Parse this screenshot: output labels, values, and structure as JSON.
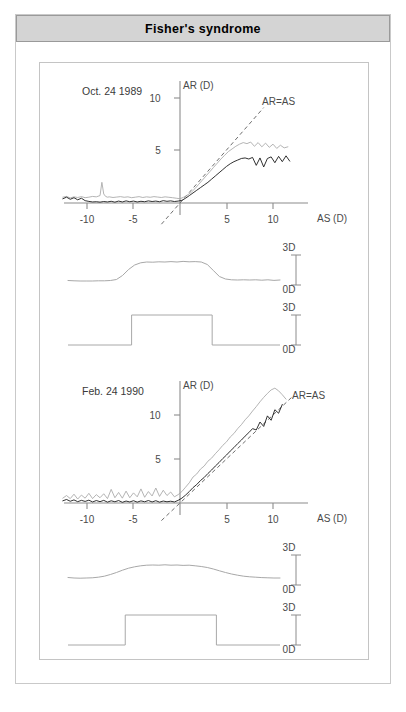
{
  "title": "Fisher's  syndrome",
  "panels": [
    {
      "date_label": "Oct. 24 1989",
      "identity_label": "AR=AS",
      "scale_top": "3D",
      "scale_bottom": "0D",
      "chart_data": {
        "type": "line",
        "title": "Oct. 24 1989",
        "xlabel": "AS (D)",
        "ylabel": "AR (D)",
        "xlim": [
          -13,
          13
        ],
        "ylim": [
          -1.2,
          11.5
        ],
        "xticks": [
          -10,
          -5,
          5,
          10
        ],
        "yticks": [
          5,
          10
        ],
        "grid": false,
        "legend": "none",
        "annotations": [
          "AR=AS"
        ],
        "series": [
          {
            "name": "accommodative-response-gray",
            "color": "#a6a6a6",
            "x": [
              -12.6,
              -12.2,
              -11.8,
              -11.4,
              -11.0,
              -10.6,
              -10.2,
              -9.8,
              -9.4,
              -9.0,
              -8.6,
              -8.4,
              -8.2,
              -8.0,
              -7.8,
              -7.6,
              -7.2,
              -6.8,
              -6.4,
              -6.0,
              -5.6,
              -5.2,
              -4.8,
              -4.4,
              -4.0,
              -3.6,
              -3.2,
              -2.8,
              -2.4,
              -2.0,
              -1.6,
              -1.2,
              -0.8,
              -0.4,
              0.0,
              0.4,
              0.8,
              1.2,
              1.6,
              2.0,
              2.4,
              2.8,
              3.2,
              3.6,
              4.0,
              4.4,
              4.8,
              5.2,
              5.6,
              6.0,
              6.4,
              6.8,
              7.2,
              7.6,
              8.0,
              8.4,
              8.8,
              9.2,
              9.6,
              10.0,
              10.4,
              10.8,
              11.2,
              11.6
            ],
            "y": [
              0.55,
              0.62,
              0.48,
              0.58,
              0.52,
              0.6,
              0.5,
              0.55,
              0.62,
              0.58,
              0.7,
              1.95,
              0.85,
              0.62,
              0.55,
              0.58,
              0.52,
              0.56,
              0.6,
              0.54,
              0.58,
              0.5,
              0.55,
              0.6,
              0.52,
              0.58,
              0.54,
              0.6,
              0.56,
              0.52,
              0.58,
              0.54,
              0.5,
              0.45,
              0.4,
              0.55,
              0.75,
              1.0,
              1.35,
              1.75,
              2.15,
              2.55,
              2.95,
              3.35,
              3.75,
              4.15,
              4.5,
              4.85,
              5.1,
              5.35,
              5.55,
              5.7,
              5.6,
              5.75,
              5.35,
              5.7,
              5.3,
              5.65,
              5.25,
              5.55,
              5.15,
              5.45,
              5.2,
              5.3
            ]
          },
          {
            "name": "accommodative-response-black",
            "color": "#1a1a1a",
            "x": [
              -12.6,
              -12.2,
              -11.8,
              -11.4,
              -11.0,
              -10.6,
              -10.2,
              -9.8,
              -9.4,
              -9.0,
              -8.6,
              -8.2,
              -7.8,
              -7.4,
              -7.0,
              -6.6,
              -6.2,
              -5.8,
              -5.4,
              -5.0,
              -4.6,
              -4.2,
              -3.8,
              -3.4,
              -3.0,
              -2.6,
              -2.2,
              -1.8,
              -1.4,
              -1.0,
              -0.6,
              -0.2,
              0.2,
              0.6,
              1.0,
              1.4,
              1.8,
              2.2,
              2.6,
              3.0,
              3.4,
              3.8,
              4.2,
              4.6,
              5.0,
              5.4,
              5.8,
              6.2,
              6.6,
              7.0,
              7.4,
              7.8,
              8.2,
              8.6,
              9.0,
              9.4,
              9.8,
              10.2,
              10.6,
              11.0,
              11.4,
              11.8
            ],
            "y": [
              0.4,
              0.55,
              0.35,
              0.5,
              0.3,
              0.45,
              0.22,
              0.15,
              0.1,
              0.12,
              0.08,
              0.14,
              0.1,
              0.16,
              0.08,
              0.18,
              0.1,
              0.2,
              0.12,
              0.18,
              0.1,
              0.16,
              0.12,
              0.2,
              0.14,
              0.18,
              0.12,
              0.22,
              0.16,
              0.2,
              0.14,
              0.18,
              0.25,
              0.45,
              0.7,
              0.95,
              1.2,
              1.45,
              1.7,
              1.95,
              2.25,
              2.55,
              2.85,
              3.15,
              3.45,
              3.7,
              3.9,
              4.05,
              4.2,
              4.25,
              4.15,
              4.3,
              3.55,
              4.25,
              3.4,
              4.2,
              4.35,
              3.8,
              4.4,
              3.9,
              4.45,
              3.95
            ]
          },
          {
            "name": "identity-line",
            "color": "#6e6e6e",
            "style": "dashed",
            "x": [
              -2.0,
              9.0
            ],
            "y": [
              -2.0,
              9.0
            ]
          }
        ]
      },
      "response_trace": {
        "type": "line",
        "name": "accommodation-response-time-trace",
        "ylim": [
          0,
          3
        ],
        "values": [
          0.45,
          0.42,
          0.4,
          0.4,
          0.4,
          0.42,
          0.42,
          0.45,
          0.55,
          0.95,
          1.55,
          2.0,
          2.22,
          2.3,
          2.28,
          2.32,
          2.3,
          2.34,
          2.3,
          2.36,
          2.32,
          2.34,
          2.3,
          2.05,
          1.45,
          0.85,
          0.6,
          0.52,
          0.5,
          0.52,
          0.5,
          0.52,
          0.48,
          0.52,
          0.46,
          0.5
        ]
      },
      "stimulus_trace": {
        "type": "step",
        "name": "stimulus-square-wave",
        "ylim": [
          0,
          3
        ],
        "low": 0,
        "high": 3,
        "step_up_frac": 0.3,
        "step_down_frac": 0.68
      }
    },
    {
      "date_label": "Feb. 24 1990",
      "identity_label": "AR=AS",
      "scale_top": "3D",
      "scale_bottom": "0D",
      "chart_data": {
        "type": "line",
        "title": "Feb. 24 1990",
        "xlabel": "AS (D)",
        "ylabel": "AR (D)",
        "xlim": [
          -13,
          13
        ],
        "ylim": [
          -1.2,
          14.0
        ],
        "xticks": [
          -10,
          -5,
          5,
          10
        ],
        "yticks": [
          5,
          10
        ],
        "grid": false,
        "legend": "none",
        "annotations": [
          "AR=AS"
        ],
        "series": [
          {
            "name": "accommodative-response-gray",
            "color": "#a6a6a6",
            "x": [
              -12.6,
              -12.2,
              -11.8,
              -11.4,
              -11.0,
              -10.6,
              -10.2,
              -9.8,
              -9.4,
              -9.0,
              -8.6,
              -8.2,
              -7.8,
              -7.4,
              -7.0,
              -6.6,
              -6.2,
              -5.8,
              -5.4,
              -5.0,
              -4.6,
              -4.2,
              -3.8,
              -3.4,
              -3.0,
              -2.6,
              -2.2,
              -1.8,
              -1.4,
              -1.0,
              -0.6,
              -0.2,
              0.2,
              0.6,
              1.0,
              1.4,
              1.8,
              2.2,
              2.6,
              3.0,
              3.4,
              3.8,
              4.2,
              4.6,
              5.0,
              5.4,
              5.8,
              6.2,
              6.6,
              7.0,
              7.4,
              7.8,
              8.2,
              8.6,
              9.0,
              9.4,
              9.8,
              10.2,
              10.6,
              11.0,
              11.4
            ],
            "y": [
              0.55,
              0.85,
              0.5,
              1.0,
              0.45,
              0.9,
              0.55,
              1.1,
              0.5,
              0.95,
              0.6,
              1.05,
              0.5,
              1.55,
              0.6,
              1.2,
              0.55,
              1.35,
              0.6,
              1.15,
              0.7,
              1.6,
              0.65,
              1.3,
              0.8,
              1.7,
              0.75,
              1.45,
              0.85,
              1.25,
              0.7,
              0.95,
              1.3,
              1.8,
              2.3,
              2.95,
              3.3,
              3.85,
              4.2,
              4.75,
              5.1,
              5.6,
              6.05,
              6.55,
              6.95,
              7.5,
              7.9,
              8.45,
              8.9,
              9.45,
              9.9,
              10.45,
              10.95,
              11.5,
              12.0,
              12.45,
              12.85,
              13.05,
              12.75,
              12.3,
              11.8
            ]
          },
          {
            "name": "accommodative-response-black",
            "color": "#1a1a1a",
            "x": [
              -12.6,
              -12.2,
              -11.8,
              -11.4,
              -11.0,
              -10.6,
              -10.2,
              -9.8,
              -9.4,
              -9.0,
              -8.6,
              -8.2,
              -7.8,
              -7.4,
              -7.0,
              -6.6,
              -6.2,
              -5.8,
              -5.4,
              -5.0,
              -4.6,
              -4.2,
              -3.8,
              -3.4,
              -3.0,
              -2.6,
              -2.2,
              -1.8,
              -1.4,
              -1.0,
              -0.6,
              -0.2,
              0.2,
              0.6,
              1.0,
              1.4,
              1.8,
              2.2,
              2.6,
              3.0,
              3.4,
              3.8,
              4.2,
              4.6,
              5.0,
              5.4,
              5.8,
              6.2,
              6.6,
              7.0,
              7.4,
              7.8,
              8.2,
              8.6,
              9.0,
              9.4,
              9.8,
              10.2,
              10.6,
              11.0
            ],
            "y": [
              0.25,
              0.4,
              0.2,
              0.35,
              0.15,
              0.3,
              0.18,
              0.32,
              0.12,
              0.28,
              0.15,
              0.3,
              0.1,
              0.25,
              0.14,
              0.28,
              0.08,
              0.22,
              0.12,
              0.26,
              0.1,
              0.24,
              0.14,
              0.28,
              0.12,
              0.26,
              0.1,
              0.22,
              0.14,
              0.2,
              0.12,
              0.3,
              0.55,
              0.9,
              1.3,
              1.75,
              2.1,
              2.55,
              2.9,
              3.35,
              3.75,
              4.2,
              4.6,
              5.05,
              5.45,
              5.9,
              6.3,
              6.75,
              7.15,
              7.6,
              8.0,
              8.45,
              8.3,
              9.2,
              8.7,
              9.9,
              9.4,
              10.6,
              10.2,
              11.2
            ]
          },
          {
            "name": "identity-line",
            "color": "#6e6e6e",
            "style": "dashed",
            "x": [
              -2.0,
              12.0
            ],
            "y": [
              -2.0,
              12.0
            ]
          }
        ]
      },
      "response_trace": {
        "type": "line",
        "name": "accommodation-response-time-trace",
        "ylim": [
          0,
          3
        ],
        "values": [
          0.75,
          0.7,
          0.68,
          0.7,
          0.72,
          0.78,
          0.88,
          1.05,
          1.25,
          1.48,
          1.68,
          1.82,
          1.92,
          1.98,
          2.0,
          1.98,
          2.02,
          1.98,
          2.0,
          1.96,
          1.98,
          1.92,
          1.85,
          1.75,
          1.6,
          1.42,
          1.25,
          1.1,
          0.98,
          0.88,
          0.82,
          0.78,
          0.74,
          0.72,
          0.7,
          0.7
        ]
      },
      "stimulus_trace": {
        "type": "step",
        "name": "stimulus-square-wave",
        "ylim": [
          0,
          3
        ],
        "low": 0,
        "high": 3,
        "step_up_frac": 0.27,
        "step_down_frac": 0.7
      }
    }
  ]
}
